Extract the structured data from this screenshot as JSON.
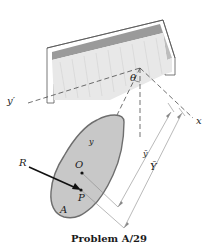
{
  "figure": {
    "caption": "Problem A/29",
    "labels": {
      "theta": "θ",
      "y_prime": "y′",
      "x": "x",
      "y": "y",
      "y_bar": "ȳ",
      "Y_bar": "Ȳ",
      "R": "R",
      "O": "O",
      "P": "P",
      "A": "A"
    },
    "colors": {
      "plate_fill": "#c8c8c8",
      "plate_edge": "#6e6e6e",
      "ceiling_top": "#e9e9e9",
      "ceiling_wall": "#9a9a9a",
      "line": "#333333",
      "dim_line": "#8a8a8a"
    }
  }
}
